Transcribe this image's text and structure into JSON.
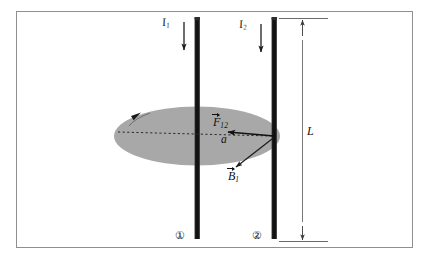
{
  "figure": {
    "type": "physics-diagram",
    "frame": {
      "border_color": "#8d8f91",
      "background": "#ffffff"
    },
    "wires": [
      {
        "id": "wire-1",
        "number_label": "①",
        "current_label_base": "I",
        "current_label_sub": "1",
        "current_direction": "down",
        "color": "#1c1c1c"
      },
      {
        "id": "wire-2",
        "number_label": "②",
        "current_label_base": "I",
        "current_label_sub": "2",
        "current_direction": "down",
        "color": "#1c1c1c"
      }
    ],
    "field_region": {
      "name": "magnetic-field-circle",
      "fill": "#a8a8a8",
      "circulation_arrow": "counterclockwise-top-left"
    },
    "vectors": [
      {
        "name": "force-vector",
        "label_base": "F",
        "label_sub": "12",
        "direction": "left",
        "color": "#111111"
      },
      {
        "name": "magnetic-field-vector",
        "label_base": "B",
        "label_sub": "1",
        "direction": "down-left",
        "color": "#111111"
      }
    ],
    "separation": {
      "name": "wire-separation",
      "label": "a",
      "line_style": "dashed"
    },
    "length_dimension": {
      "name": "wire-length",
      "label": "L",
      "orientation": "vertical",
      "arrow_ends": "both"
    }
  }
}
